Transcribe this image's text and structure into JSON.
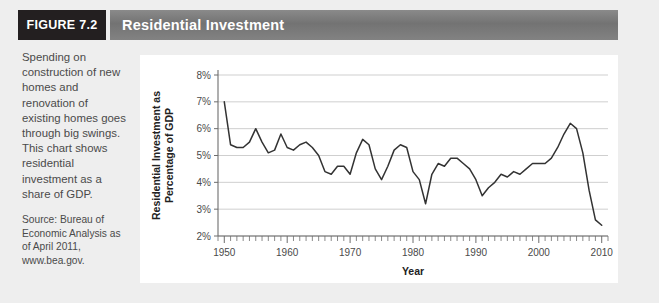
{
  "header": {
    "figure_badge": "FIGURE 7.2",
    "title": "Residential Investment"
  },
  "caption": {
    "body": "Spending on construction of new homes and renovation of existing homes goes through big swings. This chart shows residential investment as a share of GDP.",
    "source": "Source: Bureau of Economic Analysis as of April 2011, www.bea.gov."
  },
  "colors": {
    "badge_background": "#231f20",
    "title_bar": "#7a7a7a",
    "page_background": "#eeeeee",
    "panel_background": "#ffffff",
    "line": "#333333",
    "gridline": "#c9c9c9",
    "axis": "#6d6d6d"
  },
  "chart_data": {
    "type": "line",
    "title": "Residential Investment",
    "xlabel": "Year",
    "ylabel": "Residential Investment as Percentage of GDP",
    "xlim": [
      1949,
      2011
    ],
    "ylim": [
      2,
      8
    ],
    "ytick_labels": [
      "8%",
      "7%",
      "6%",
      "5%",
      "4%",
      "3%",
      "2%"
    ],
    "ytick_values": [
      8,
      7,
      6,
      5,
      4,
      3,
      2
    ],
    "xtick_labels": [
      "1950",
      "1960",
      "1970",
      "1980",
      "1990",
      "2000",
      "2010"
    ],
    "xtick_values": [
      1950,
      1960,
      1970,
      1980,
      1990,
      2000,
      2010
    ],
    "minor_tick_interval": 1,
    "grid": "horizontal",
    "legend": "none",
    "series": [
      {
        "name": "Residential investment as percentage of GDP",
        "x": [
          1950,
          1951,
          1952,
          1953,
          1954,
          1955,
          1956,
          1957,
          1958,
          1959,
          1960,
          1961,
          1962,
          1963,
          1964,
          1965,
          1966,
          1967,
          1968,
          1969,
          1970,
          1971,
          1972,
          1973,
          1974,
          1975,
          1976,
          1977,
          1978,
          1979,
          1980,
          1981,
          1982,
          1983,
          1984,
          1985,
          1986,
          1987,
          1988,
          1989,
          1990,
          1991,
          1992,
          1993,
          1994,
          1995,
          1996,
          1997,
          1998,
          1999,
          2000,
          2001,
          2002,
          2003,
          2004,
          2005,
          2006,
          2007,
          2008,
          2009,
          2010
        ],
        "values": [
          7.0,
          5.4,
          5.3,
          5.3,
          5.5,
          6.0,
          5.5,
          5.1,
          5.2,
          5.8,
          5.3,
          5.2,
          5.4,
          5.5,
          5.3,
          5.0,
          4.4,
          4.3,
          4.6,
          4.6,
          4.3,
          5.1,
          5.6,
          5.4,
          4.5,
          4.1,
          4.6,
          5.2,
          5.4,
          5.3,
          4.4,
          4.1,
          3.2,
          4.3,
          4.7,
          4.6,
          4.9,
          4.9,
          4.7,
          4.5,
          4.1,
          3.5,
          3.8,
          4.0,
          4.3,
          4.2,
          4.4,
          4.3,
          4.5,
          4.7,
          4.7,
          4.7,
          4.9,
          5.3,
          5.8,
          6.2,
          6.0,
          5.1,
          3.7,
          2.6,
          2.4
        ]
      }
    ]
  }
}
